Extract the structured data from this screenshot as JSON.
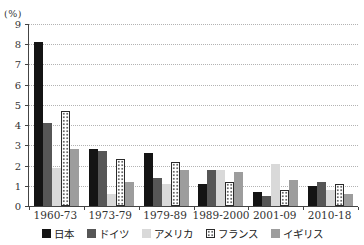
{
  "chart": {
    "ylabel": "(%)"
  },
  "chart_data": {
    "type": "bar",
    "categories": [
      "1960-73",
      "1973-79",
      "1979-89",
      "1989-2000",
      "2001-09",
      "2010-18"
    ],
    "series": [
      {
        "name": "日本",
        "color": "#141414",
        "pattern": "solid",
        "values": [
          8.1,
          2.8,
          2.6,
          1.1,
          0.7,
          1.0
        ]
      },
      {
        "name": "ドイツ",
        "color": "#565656",
        "pattern": "solid",
        "values": [
          4.1,
          2.7,
          1.4,
          1.8,
          0.5,
          1.2
        ]
      },
      {
        "name": "アメリカ",
        "color": "#d9d9d9",
        "pattern": "solid",
        "values": [
          1.9,
          0.6,
          1.1,
          1.8,
          2.1,
          0.8
        ]
      },
      {
        "name": "フランス",
        "color": "#ffffff",
        "pattern": "dots",
        "values": [
          4.7,
          2.3,
          2.2,
          1.2,
          0.8,
          1.1
        ]
      },
      {
        "name": "イギリス",
        "color": "#9d9d9d",
        "pattern": "solid",
        "values": [
          2.8,
          1.2,
          1.8,
          1.7,
          1.3,
          0.6
        ]
      }
    ],
    "ylim": [
      0,
      9
    ],
    "yticks": [
      0,
      1,
      2,
      3,
      4,
      5,
      6,
      7,
      8,
      9
    ],
    "grid": true,
    "legend_position": "bottom"
  }
}
